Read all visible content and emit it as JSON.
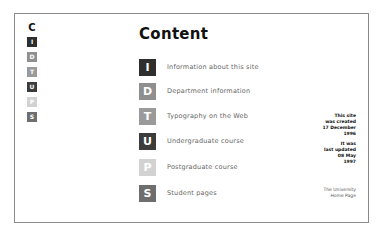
{
  "sidebar": {
    "heading": "C",
    "items": [
      {
        "letter": "I",
        "color": "#2e2e2e"
      },
      {
        "letter": "D",
        "color": "#8f8f8f"
      },
      {
        "letter": "T",
        "color": "#9a9a9a"
      },
      {
        "letter": "U",
        "color": "#3c3c3c"
      },
      {
        "letter": "P",
        "color": "#d2d2d2"
      },
      {
        "letter": "S",
        "color": "#6e6e6e"
      }
    ]
  },
  "main": {
    "title": "Content",
    "items": [
      {
        "letter": "I",
        "label": "Information about this site",
        "color": "#2e2e2e"
      },
      {
        "letter": "D",
        "label": "Department information",
        "color": "#8f8f8f"
      },
      {
        "letter": "T",
        "label": "Typography on the Web",
        "color": "#9a9a9a"
      },
      {
        "letter": "U",
        "label": "Undergraduate course",
        "color": "#3c3c3c"
      },
      {
        "letter": "P",
        "label": "Postgraduate course",
        "color": "#d2d2d2"
      },
      {
        "letter": "S",
        "label": "Student pages",
        "color": "#6e6e6e"
      }
    ]
  },
  "notes": {
    "created": [
      "This site",
      "was created",
      "17 December",
      "1996"
    ],
    "updated": [
      "It was",
      "last updated",
      "08 May",
      "1997"
    ]
  },
  "footer_link": [
    "The University",
    "Home Page"
  ]
}
